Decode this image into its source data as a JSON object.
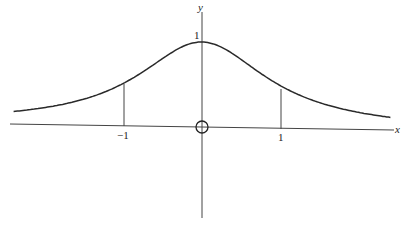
{
  "chart_data": {
    "type": "line",
    "title": "",
    "function": "y = 1/(1+x^2)",
    "xlabel": "x",
    "ylabel": "y",
    "x_ticks": [
      {
        "value": -1,
        "label": "−1"
      },
      {
        "value": 1,
        "label": "1"
      }
    ],
    "y_ticks": [
      {
        "value": 1,
        "label": "1"
      }
    ],
    "origin_marker": "circle",
    "vertical_markers": [
      -1,
      1
    ],
    "xlim": [
      -2.4,
      2.4
    ],
    "ylim": [
      -1.1,
      1.3
    ],
    "grid": false,
    "legend": null,
    "series": [
      {
        "name": "curve",
        "x": [
          -2.4,
          -2,
          -1.5,
          -1,
          -0.5,
          0,
          0.5,
          1,
          1.5,
          2,
          2.4
        ],
        "values": [
          0.148,
          0.2,
          0.308,
          0.5,
          0.8,
          1.0,
          0.8,
          0.5,
          0.308,
          0.2,
          0.148
        ]
      }
    ]
  },
  "labels": {
    "y_axis": "y",
    "x_axis": "x",
    "y_tick_1": "1",
    "x_tick_neg1": "−1",
    "x_tick_1": "1"
  },
  "colors": {
    "line": "#2a2a2a",
    "axis": "#444444",
    "background": "#ffffff"
  }
}
